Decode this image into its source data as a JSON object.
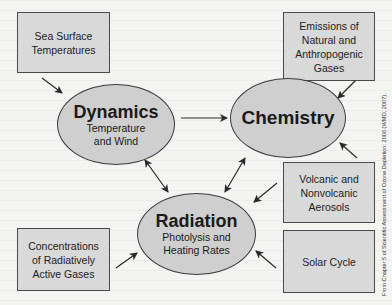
{
  "diagram": {
    "nodes": {
      "dynamics": {
        "title": "Dynamics",
        "subtitle_line1": "Temperature",
        "subtitle_line2": "and Wind"
      },
      "chemistry": {
        "title": "Chemistry"
      },
      "radiation": {
        "title": "Radiation",
        "subtitle_line1": "Photolysis and",
        "subtitle_line2": "Heating Rates"
      }
    },
    "inputs": {
      "sea_surface": {
        "line1": "Sea Surface",
        "line2": "Temperatures"
      },
      "emissions": {
        "line1": "Emissions of",
        "line2": "Natural and",
        "line3": "Anthropogenic",
        "line4": "Gases"
      },
      "aerosols": {
        "line1": "Volcanic and",
        "line2": "Nonvolcanic",
        "line3": "Aerosols"
      },
      "solar": {
        "line1": "Solar Cycle"
      },
      "concentrations": {
        "line1": "Concentrations",
        "line2": "of Radiatively",
        "line3": "Active Gases"
      }
    },
    "connections": [
      {
        "from": "Sea Surface Temperatures",
        "to": "Dynamics",
        "type": "one-way"
      },
      {
        "from": "Dynamics",
        "to": "Chemistry",
        "type": "one-way"
      },
      {
        "from": "Emissions of Natural and Anthropogenic Gases",
        "to": "Chemistry",
        "type": "one-way"
      },
      {
        "from": "Volcanic and Nonvolcanic Aerosols",
        "to": "Chemistry",
        "type": "one-way"
      },
      {
        "from": "Volcanic and Nonvolcanic Aerosols",
        "to": "Radiation",
        "type": "one-way"
      },
      {
        "from": "Dynamics",
        "to": "Radiation",
        "type": "two-way"
      },
      {
        "from": "Chemistry",
        "to": "Radiation",
        "type": "two-way"
      },
      {
        "from": "Concentrations of Radiatively Active Gases",
        "to": "Radiation",
        "type": "one-way"
      },
      {
        "from": "Solar Cycle",
        "to": "Radiation",
        "type": "one-way"
      }
    ],
    "credit": "From Chapter 5 of Scientific Assessment of Ozone Depletion: 2006 (WMO, 2007)."
  },
  "colors": {
    "background": "#f4f4f2",
    "box_fill": "#d9d9d9",
    "ellipse_fill": "#cfcfcf",
    "stroke": "#3c3c3c"
  }
}
